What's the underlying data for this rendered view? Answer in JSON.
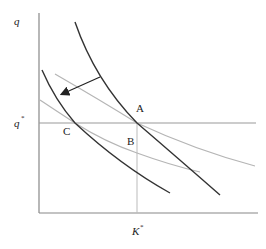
{
  "diagram": {
    "axes": {
      "y_label": "q",
      "x_label": "K",
      "x_label_sup": "*",
      "y_ref_label": "q",
      "y_ref_sup": "*"
    },
    "points": {
      "A": "A",
      "B": "B",
      "C": "C"
    },
    "colors": {
      "dark_curve": "#333333",
      "gray_line": "#b0b0b0",
      "axis": "#888888",
      "reference_line": "#999999"
    }
  }
}
